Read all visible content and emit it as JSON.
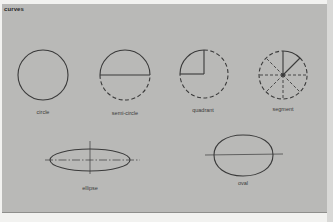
{
  "title": "curves",
  "colors": {
    "panel_background": "#b9b9b7",
    "stroke": "#3a3a3a",
    "page_background": "#f2f2f0"
  },
  "shapes": [
    {
      "id": "circle",
      "label": "circle",
      "description": "solid circle outline"
    },
    {
      "id": "semi-circle",
      "label": "semi-circle",
      "description": "upper half solid with diameter line, lower half dashed"
    },
    {
      "id": "quadrant",
      "label": "quadrant",
      "description": "upper-left quarter solid with two radii, remainder dashed"
    },
    {
      "id": "segment",
      "label": "segment",
      "description": "circle divided by dashed radii into eighths, one segment solid"
    },
    {
      "id": "ellipse",
      "label": "ellipse",
      "description": "horizontal ellipse with dash-dot axes"
    },
    {
      "id": "oval",
      "label": "oval",
      "description": "egg-shaped oval with horizontal axis"
    }
  ]
}
